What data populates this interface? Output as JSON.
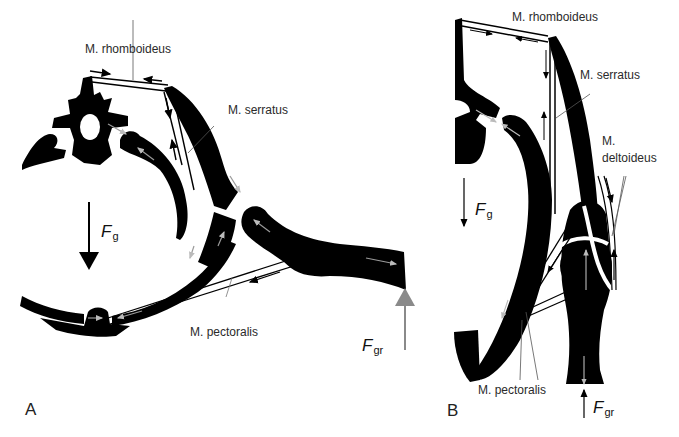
{
  "figure": {
    "panels": [
      {
        "id": "A",
        "label": "A",
        "view": "transverse section (cross-section through thorax)",
        "muscles": [
          "M. rhomboideus",
          "M. serratus",
          "M. pectoralis"
        ],
        "forces": {
          "gravity": {
            "symbol": "F",
            "subscript": "g"
          },
          "ground": {
            "symbol": "F",
            "subscript": "gr"
          }
        }
      },
      {
        "id": "B",
        "label": "B",
        "view": "lateral view",
        "muscles": [
          "M. rhomboideus",
          "M. serratus",
          "M.",
          "deltoideus",
          "M. pectoralis"
        ],
        "forces": {
          "gravity": {
            "symbol": "F",
            "subscript": "g"
          },
          "ground": {
            "symbol": "F",
            "subscript": "gr"
          }
        }
      }
    ],
    "colors": {
      "bone": "#000000",
      "muscle_outline": "#000000",
      "force_gray": "#888888",
      "background": "#ffffff"
    }
  }
}
